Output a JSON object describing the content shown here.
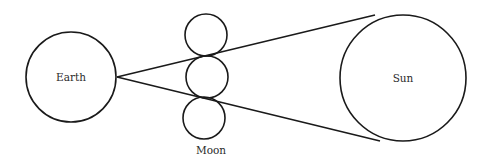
{
  "diagram": {
    "labels": {
      "earth": "Earth",
      "moon": "Moon",
      "sun": "Sun"
    },
    "bodies": {
      "earth": {
        "cx": 71,
        "cy": 77,
        "r": 45
      },
      "moons": [
        {
          "cx": 206,
          "cy": 35,
          "r": 21
        },
        {
          "cx": 207,
          "cy": 77,
          "r": 21
        },
        {
          "cx": 204,
          "cy": 118,
          "r": 21
        }
      ],
      "sun": {
        "cx": 403,
        "cy": 78,
        "r": 63
      }
    },
    "rays": [
      {
        "x1": 117,
        "y1": 77,
        "x2": 375,
        "y2": 15
      },
      {
        "x1": 117,
        "y1": 77,
        "x2": 380,
        "y2": 141
      }
    ],
    "colors": {
      "stroke": "#1a1a1a",
      "text": "#2a2a2a",
      "background": "#ffffff"
    }
  }
}
